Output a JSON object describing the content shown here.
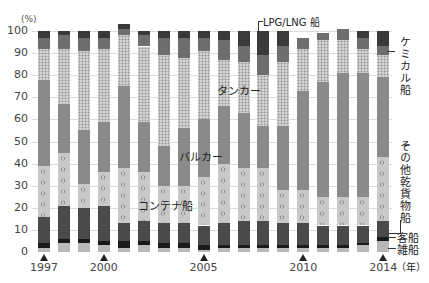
{
  "chart_data": {
    "type": "bar",
    "stacked": true,
    "title": "",
    "ylabel": "(%)",
    "xlabel": "(年)",
    "ylim": [
      0,
      100
    ],
    "yticks": [
      0,
      10,
      20,
      30,
      40,
      50,
      60,
      70,
      80,
      90,
      100
    ],
    "grid": true,
    "categories": [
      "1997",
      "1998",
      "1999",
      "2000",
      "2001",
      "2002",
      "2003",
      "2004",
      "2005",
      "2006",
      "2007",
      "2008",
      "2009",
      "2010",
      "2011",
      "2012",
      "2013",
      "2014"
    ],
    "xtick_labels": [
      {
        "year": "1997",
        "label": "1997"
      },
      {
        "year": "2000",
        "label": "2000"
      },
      {
        "year": "2005",
        "label": "2005"
      },
      {
        "year": "2010",
        "label": "2010"
      },
      {
        "year": "2014",
        "label": "2014"
      }
    ],
    "series": [
      {
        "name": "雑船",
        "color": "#b8b8b8",
        "pattern": "solid",
        "values": [
          2,
          4,
          4,
          3,
          2,
          3,
          2,
          2,
          1,
          2,
          2,
          2,
          2,
          2,
          2,
          2,
          3,
          5
        ]
      },
      {
        "name": "客船",
        "color": "#1a1a1a",
        "pattern": "solid",
        "values": [
          2,
          2,
          2,
          2,
          3,
          2,
          2,
          2,
          2,
          1,
          1,
          1,
          1,
          1,
          1,
          1,
          1,
          2
        ]
      },
      {
        "name": "コンテナ船",
        "color": "#4a4a4a",
        "pattern": "solid",
        "values": [
          12,
          15,
          14,
          16,
          8,
          9,
          9,
          9,
          9,
          10,
          11,
          11,
          10,
          10,
          9,
          9,
          8,
          7
        ]
      },
      {
        "name": "その他乾貨物船",
        "color": "#c8c8c8",
        "pattern": "circles",
        "values": [
          23,
          24,
          11,
          15,
          25,
          22,
          17,
          17,
          22,
          27,
          24,
          24,
          15,
          15,
          13,
          13,
          13,
          29
        ]
      },
      {
        "name": "バルカー",
        "color": "#8a8a8a",
        "pattern": "solid",
        "values": [
          39,
          22,
          24,
          23,
          37,
          23,
          18,
          26,
          26,
          26,
          25,
          19,
          29,
          45,
          52,
          56,
          56,
          36
        ]
      },
      {
        "name": "タンカー",
        "color": "#d4d4d4",
        "pattern": "dots",
        "values": [
          14,
          25,
          36,
          33,
          23,
          34,
          41,
          32,
          31,
          21,
          23,
          23,
          29,
          19,
          19,
          15,
          11,
          10
        ]
      },
      {
        "name": "ケミカル船",
        "color": "#6e6e6e",
        "pattern": "solid",
        "values": [
          5,
          6,
          6,
          5,
          3,
          5,
          8,
          9,
          6,
          9,
          7,
          9,
          7,
          5,
          3,
          5,
          5,
          4
        ]
      },
      {
        "name": "LPG/LNG 船",
        "color": "#3a3a3a",
        "pattern": "solid",
        "values": [
          3,
          2,
          3,
          3,
          2,
          2,
          3,
          3,
          3,
          4,
          7,
          11,
          7,
          0,
          0,
          0,
          3,
          7
        ]
      }
    ]
  },
  "labels": {
    "unit": "(%)",
    "year_unit": "（年）",
    "lpg": "LPG/LNG 船",
    "chemical": "ケミカル船",
    "tanker": "タンカー",
    "bulker": "バルカー",
    "other_dry": "その他乾貨物船",
    "container": "コンテナ船",
    "passenger": "客船",
    "misc": "雑船"
  }
}
